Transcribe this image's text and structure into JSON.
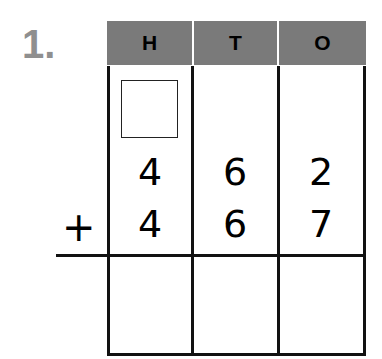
{
  "problem": {
    "number_label": "1.",
    "headers": [
      "H",
      "T",
      "O"
    ],
    "addend1": [
      "4",
      "6",
      "2"
    ],
    "addend2": [
      "4",
      "6",
      "7"
    ],
    "operator": "+",
    "carry_box": "",
    "answer": [
      "",
      "",
      ""
    ]
  }
}
